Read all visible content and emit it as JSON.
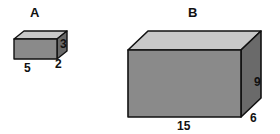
{
  "figure": {
    "background_color": "#ffffff",
    "outline_color": "#111111",
    "face_colors": {
      "front": "#8a8a8a",
      "top": "#c8c8c8",
      "side": "#6a6a6a"
    },
    "prisms": [
      {
        "name": "A",
        "shape": "rectangular-prism",
        "dimensions": {
          "width": "5",
          "depth": "2",
          "height": "3"
        }
      },
      {
        "name": "B",
        "shape": "rectangular-prism",
        "dimensions": {
          "width": "15",
          "depth": "6",
          "height": "9"
        }
      }
    ]
  },
  "geometry": {
    "box_a": {
      "front": "14,39 14,59 57,59 57,39",
      "top": "14,39 24,31 67,31 57,39",
      "side": "57,39 67,31 67,51 57,59"
    },
    "box_b": {
      "front": "128,50 128,117 241,117 241,50",
      "top": "128,50 148,31 261,31 241,50",
      "side": "241,50 261,31 261,98 241,117"
    }
  }
}
